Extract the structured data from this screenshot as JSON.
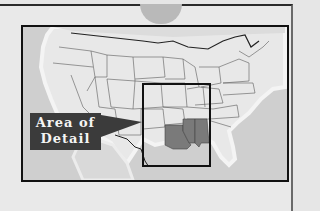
{
  "map": {
    "title": "",
    "region": "Contiguous United States",
    "label": {
      "line1": "Area of",
      "line2": "Detail"
    },
    "highlighted_states": [
      "Louisiana",
      "Mississippi",
      "Alabama"
    ],
    "colors": {
      "background": "#e9e9e9",
      "ocean": "#cfcfcf",
      "land": "#e8e8e8",
      "state_border": "#555555",
      "highlight": "#7a7a7a",
      "frame": "#111111",
      "label_bg": "#3b3b3b",
      "label_text": "#f4f4f4"
    }
  }
}
